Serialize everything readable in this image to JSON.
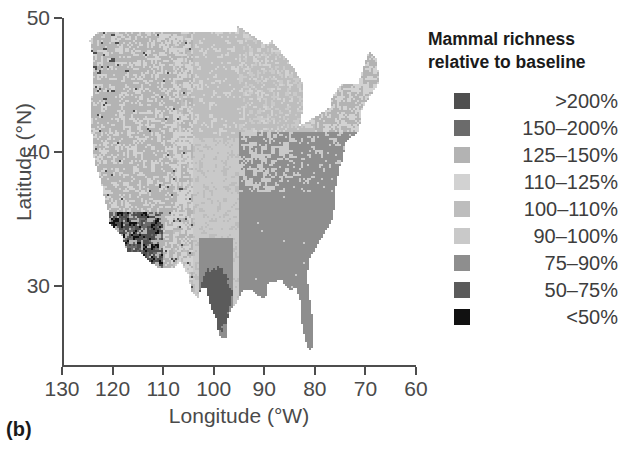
{
  "panel": {
    "label": "(b)"
  },
  "axes": {
    "ylabel": "Latitude (°N)",
    "xlabel": "Longitude (°W)",
    "yticks": [
      "50",
      "40",
      "30"
    ],
    "xticks": [
      "130",
      "120",
      "110",
      "100",
      "90",
      "80",
      "70",
      "60"
    ]
  },
  "legend": {
    "title_line1": "Mammal richness",
    "title_line2": "relative to baseline",
    "items": [
      {
        "label": ">200%",
        "color": "#4f4f4f"
      },
      {
        "label": "150–200%",
        "color": "#6b6b6b"
      },
      {
        "label": "125–150%",
        "color": "#b3b3b3"
      },
      {
        "label": "110–125%",
        "color": "#d2d2d2"
      },
      {
        "label": "100–110%",
        "color": "#bdbdbd"
      },
      {
        "label": "90–100%",
        "color": "#c9c9c9"
      },
      {
        "label": "75–90%",
        "color": "#8e8e8e"
      },
      {
        "label": "50–75%",
        "color": "#5b5b5b"
      },
      {
        "label": "<50%",
        "color": "#111111"
      }
    ]
  },
  "chart_data": {
    "type": "heatmap",
    "title": "Mammal richness relative to baseline",
    "xlabel": "Longitude (°W)",
    "ylabel": "Latitude (°N)",
    "xlim": [
      130,
      60
    ],
    "ylim": [
      24,
      50
    ],
    "grid": false,
    "legend_position": "right",
    "colorbar_categories": [
      ">200%",
      "150–200%",
      "125–150%",
      "110–125%",
      "100–110%",
      "90–100%",
      "75–90%",
      "50–75%",
      "<50%"
    ],
    "colorbar_colors": [
      "#4f4f4f",
      "#6b6b6b",
      "#b3b3b3",
      "#d2d2d2",
      "#bdbdbd",
      "#c9c9c9",
      "#8e8e8e",
      "#5b5b5b",
      "#111111"
    ],
    "cell_size_deg": 0.5,
    "region_summary": [
      {
        "region": "Pacific Northwest",
        "class": "125–150%"
      },
      {
        "region": "Northern Rockies",
        "class": "110–125%"
      },
      {
        "region": "Great Basin",
        "class": "125–150%"
      },
      {
        "region": "Southern California / Arizona",
        "class": "<50%"
      },
      {
        "region": "Great Plains",
        "class": "100–110%"
      },
      {
        "region": "Central Texas",
        "class": "50–75%"
      },
      {
        "region": "Midwest",
        "class": "90–100%"
      },
      {
        "region": "Southeast",
        "class": "75–90%"
      },
      {
        "region": "Florida",
        "class": "75–90%"
      },
      {
        "region": "Northeast / New England",
        "class": "110–125%"
      }
    ]
  }
}
